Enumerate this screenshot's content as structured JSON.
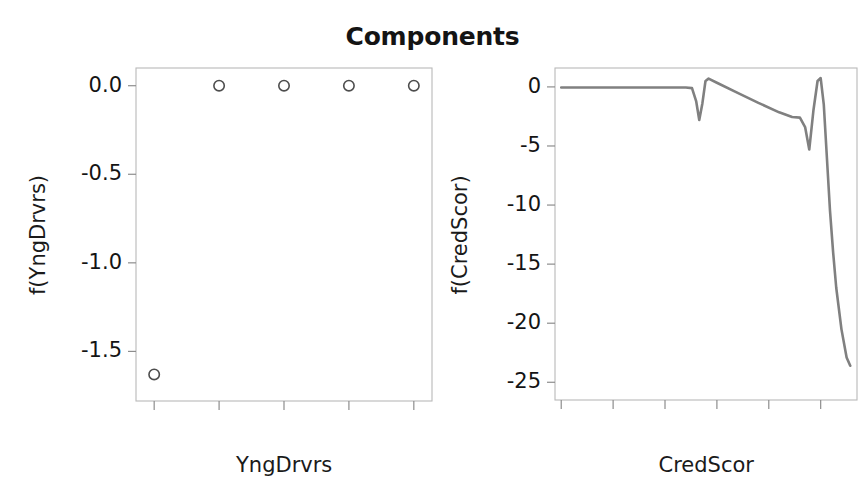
{
  "figure": {
    "title": "Components",
    "background_color": "#ffffff",
    "marker_color": "#4d4d4d",
    "line_color": "#808080",
    "grid_color": "#e8e8e8",
    "frame_color": "#b9b9b9"
  },
  "chart_data": [
    {
      "type": "scatter",
      "panel": "left",
      "title": "Components",
      "xlabel": "YngDrvrs",
      "ylabel": "f(YngDrvrs)",
      "x": [
        0,
        1,
        2,
        3,
        4
      ],
      "values": [
        -1.63,
        0.0,
        0.0,
        0.0,
        0.0
      ],
      "xticks": [
        "0",
        "1",
        "2",
        "3",
        "4"
      ],
      "xtick_values": [
        0,
        1,
        2,
        3,
        4
      ],
      "yticks": [
        "0.0",
        "-0.5",
        "-1.0",
        "-1.5"
      ],
      "ytick_values": [
        0.0,
        -0.5,
        -1.0,
        -1.5
      ],
      "xlim": [
        -0.28,
        4.28
      ],
      "ylim": [
        -1.78,
        0.1
      ],
      "grid": true,
      "legend": "none",
      "marker": "open-circle"
    },
    {
      "type": "line",
      "panel": "right",
      "title": "Components",
      "xlabel": "CredScor",
      "ylabel": "f(CredScor)",
      "xticks": [
        "300",
        "400",
        "500",
        "600",
        "700",
        "800"
      ],
      "xtick_values": [
        300,
        400,
        500,
        600,
        700,
        800
      ],
      "yticks": [
        "0",
        "-5",
        "-10",
        "-15",
        "-20",
        "-25"
      ],
      "ytick_values": [
        0,
        -5,
        -10,
        -15,
        -20,
        -25
      ],
      "xlim": [
        288,
        870
      ],
      "ylim": [
        -26.5,
        1.6
      ],
      "grid": true,
      "legend": "none",
      "x": [
        300,
        340,
        380,
        420,
        460,
        500,
        540,
        552,
        560,
        566,
        572,
        578,
        584,
        600,
        640,
        680,
        720,
        745,
        760,
        770,
        778,
        786,
        794,
        800,
        806,
        812,
        818,
        824,
        830,
        840,
        850,
        857
      ],
      "values": [
        -0.05,
        -0.05,
        -0.05,
        -0.05,
        -0.05,
        -0.05,
        -0.05,
        -0.1,
        -1.2,
        -2.8,
        -1.4,
        0.5,
        0.7,
        0.35,
        -0.5,
        -1.35,
        -2.15,
        -2.55,
        -2.6,
        -3.4,
        -5.3,
        -2.0,
        0.5,
        0.75,
        -1.5,
        -6.0,
        -10.5,
        -14.0,
        -17.0,
        -20.5,
        -22.9,
        -23.6
      ]
    }
  ],
  "left_panel": {
    "xlabel": "YngDrvrs",
    "ylabel": "f(YngDrvrs)",
    "yticks": [
      "0.0",
      "-0.5",
      "-1.0",
      "-1.5"
    ],
    "xticks": [
      "0",
      "1",
      "2",
      "3",
      "4"
    ]
  },
  "right_panel": {
    "xlabel": "CredScor",
    "ylabel": "f(CredScor)",
    "yticks": [
      "0",
      "-5",
      "-10",
      "-15",
      "-20",
      "-25"
    ],
    "xticks": [
      "300",
      "400",
      "500",
      "600",
      "700",
      "800"
    ]
  }
}
